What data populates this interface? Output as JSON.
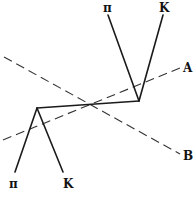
{
  "diagram": {
    "upper_vertex": {
      "products": [
        {
          "label": "π"
        },
        {
          "label": "K"
        }
      ]
    },
    "lower_vertex": {
      "products": [
        {
          "label": "π"
        },
        {
          "label": "K"
        }
      ]
    },
    "axes": [
      {
        "label": "A"
      },
      {
        "label": "B"
      }
    ]
  }
}
